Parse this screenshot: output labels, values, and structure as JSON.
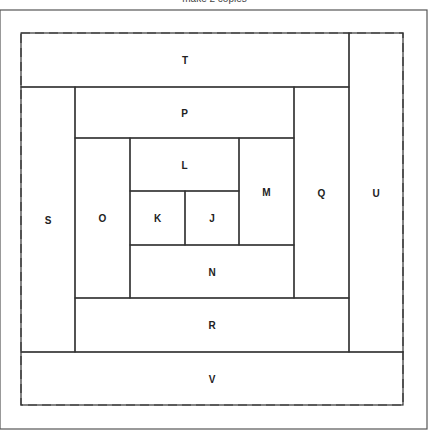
{
  "caption": "make 2 copies",
  "pieces": [
    {
      "id": "T",
      "x": 21,
      "y": 33,
      "w": 328,
      "h": 54
    },
    {
      "id": "U",
      "x": 349,
      "y": 33,
      "w": 54,
      "h": 319
    },
    {
      "id": "S",
      "x": 21,
      "y": 87,
      "w": 54,
      "h": 265
    },
    {
      "id": "P",
      "x": 75,
      "y": 87,
      "w": 219,
      "h": 51
    },
    {
      "id": "Q",
      "x": 294,
      "y": 87,
      "w": 55,
      "h": 211
    },
    {
      "id": "O",
      "x": 75,
      "y": 138,
      "w": 55,
      "h": 160
    },
    {
      "id": "L",
      "x": 130,
      "y": 138,
      "w": 109,
      "h": 53
    },
    {
      "id": "M",
      "x": 239,
      "y": 138,
      "w": 55,
      "h": 107
    },
    {
      "id": "K",
      "x": 130,
      "y": 191,
      "w": 55,
      "h": 54
    },
    {
      "id": "J",
      "x": 185,
      "y": 191,
      "w": 54,
      "h": 54
    },
    {
      "id": "N",
      "x": 130,
      "y": 245,
      "w": 164,
      "h": 53
    },
    {
      "id": "R",
      "x": 75,
      "y": 298,
      "w": 274,
      "h": 54
    },
    {
      "id": "V",
      "x": 21,
      "y": 352,
      "w": 382,
      "h": 53
    }
  ]
}
